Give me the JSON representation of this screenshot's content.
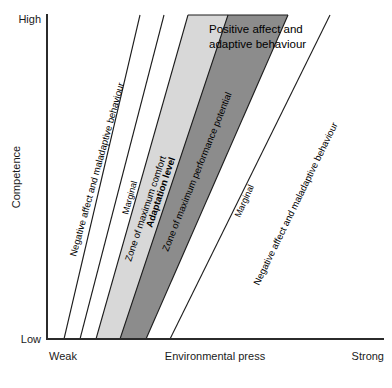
{
  "figure": {
    "type": "diagram",
    "name": "environmental-press-competence-model",
    "axes": {
      "y": {
        "title": "Competence",
        "high_label": "High",
        "low_label": "Low"
      },
      "x": {
        "title": "Environmental press",
        "left_label": "Weak",
        "right_label": "Strong"
      }
    },
    "zones": [
      {
        "id": "negative-left",
        "label": "Negative affect and maladaptive behaviour",
        "fill": "#ffffff"
      },
      {
        "id": "marginal-left",
        "label": "Marginal",
        "fill": "#ffffff"
      },
      {
        "id": "comfort",
        "label": "Zone of maximum comfort",
        "fill": "#d8d8d8"
      },
      {
        "id": "performance",
        "label": "Zone of maximum performance potential",
        "fill": "#8c8c8c"
      },
      {
        "id": "marginal-right",
        "label": "Marginal",
        "fill": "#ffffff"
      },
      {
        "id": "negative-right",
        "label": "Negative affect and maladaptive behaviour",
        "fill": "#ffffff"
      }
    ],
    "annotations": {
      "adaptation_level": "Adaptation level",
      "positive_affect_line1": "Positive affect and",
      "positive_affect_line2": "adaptive behaviour"
    },
    "colors": {
      "light_band": "#d8d8d8",
      "dark_band": "#8c8c8c",
      "axis": "#2b2b2b",
      "line": "#1c1c1c",
      "text": "#000000"
    },
    "caption_fragment": ""
  }
}
